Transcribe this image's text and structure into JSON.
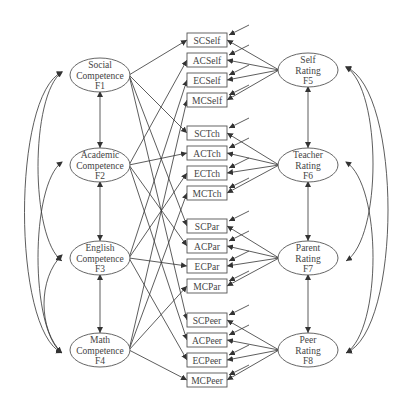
{
  "diagram": {
    "left_factors": [
      {
        "id": "F1",
        "lines": [
          "Social",
          "Competence",
          "F1"
        ]
      },
      {
        "id": "F2",
        "lines": [
          "Academic",
          "Competence",
          "F2"
        ]
      },
      {
        "id": "F3",
        "lines": [
          "English",
          "Competence",
          "F3"
        ]
      },
      {
        "id": "F4",
        "lines": [
          "Math",
          "Competence",
          "F4"
        ]
      }
    ],
    "right_factors": [
      {
        "id": "F5",
        "lines": [
          "Self",
          "Rating",
          "F5"
        ]
      },
      {
        "id": "F6",
        "lines": [
          "Teacher",
          "Rating",
          "F6"
        ]
      },
      {
        "id": "F7",
        "lines": [
          "Parent",
          "Rating",
          "F7"
        ]
      },
      {
        "id": "F8",
        "lines": [
          "Peer",
          "Rating",
          "F8"
        ]
      }
    ],
    "indicators": [
      [
        "SCSelf",
        "ACSelf",
        "ECSelf",
        "MCSelf"
      ],
      [
        "SCTch",
        "ACTch",
        "ECTch",
        "MCTch"
      ],
      [
        "SCPar",
        "ACPar",
        "ECPar",
        "MCPar"
      ],
      [
        "SCPeer",
        "ACPeer",
        "ECPeer",
        "MCPeer"
      ]
    ],
    "colors": {
      "stroke": "#555555",
      "text": "#444444",
      "background": "#ffffff"
    }
  }
}
